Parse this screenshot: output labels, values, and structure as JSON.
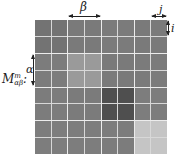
{
  "figure": {
    "title_label": {
      "base": "M",
      "superscript": "m",
      "subscript": "αβ",
      "suffix": ":"
    },
    "dimension_labels": {
      "beta": "β",
      "alpha": "α",
      "j": "j",
      "i": "i"
    },
    "grid": {
      "block_rows": 4,
      "block_cols": 4,
      "cells_per_block": 2,
      "block_colors": [
        [
          "#737373",
          "#7a7a7a",
          "#7b7b7b",
          "#7a7a7a"
        ],
        [
          "#7c7c7c",
          "#9a9a9a",
          "#7a7a7a",
          "#7b7b7b"
        ],
        [
          "#7c7c7c",
          "#7b7b7b",
          "#4f4f4f",
          "#7d7d7d"
        ],
        [
          "#7d7d7d",
          "#7d7d7d",
          "#7c7c7c",
          "#c5c5c5"
        ]
      ]
    }
  }
}
